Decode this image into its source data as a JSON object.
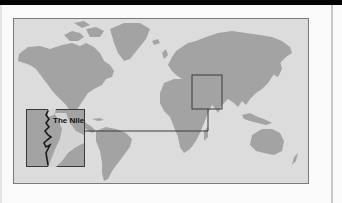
{
  "map": {
    "title": "World map highlighting the Nile region",
    "inset_label": "The Nile",
    "colors": {
      "top_bar": "#050505",
      "page_background": "#fafafa",
      "ocean": "#dcdcdc",
      "land": "#a3a3a3",
      "frame_border": "#7a7a7a",
      "callout_lines": "#3a3a3a",
      "river": "#1a1a1a"
    },
    "highlight_box": {
      "region": "Northeast Africa / Red Sea / Arabian Peninsula"
    },
    "inset": {
      "feature": "Nile River",
      "label": "The Nile"
    }
  }
}
